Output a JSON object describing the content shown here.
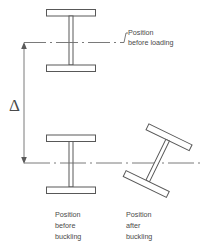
{
  "diagram": {
    "background_color": "#ffffff",
    "line_color": "#585858",
    "centerline_color": "#6b6b6b",
    "text_color": "#4a4a4a",
    "dimension": {
      "symbol": "Δ",
      "meaning": "deflection"
    },
    "labels": {
      "before_loading_line1": "Position",
      "before_loading_line2": "before loading",
      "before_buckling_line1": "Position",
      "before_buckling_line2": "before",
      "before_buckling_line3": "buckling",
      "after_buckling_line1": "Position",
      "after_buckling_line2": "after",
      "after_buckling_line3": "buckling"
    },
    "figures": {
      "upper_beam": {
        "name": "I-beam at original position",
        "rotation_deg": 0
      },
      "lower_left_beam": {
        "name": "I-beam deflected, unbuckled",
        "rotation_deg": 0
      },
      "lower_right_beam": {
        "name": "I-beam deflected and buckled",
        "rotation_deg": 26
      }
    }
  }
}
